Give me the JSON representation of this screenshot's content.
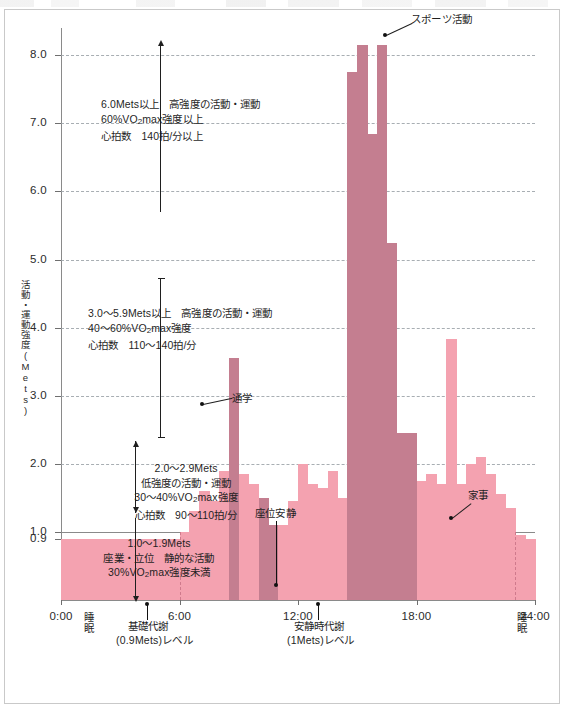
{
  "chart_data": {
    "type": "bar",
    "title": "",
    "xlabel": "",
    "ylabel": "活動・運動強度(Mets)",
    "ylim": [
      0.0,
      8.4
    ],
    "xlim": [
      0,
      24
    ],
    "grid": true,
    "legend_position": "in-plot-annotations",
    "y_ticks": [
      "8.0",
      "7.0",
      "6.0",
      "5.0",
      "4.0",
      "3.0",
      "2.0",
      "1.0",
      "0.9"
    ],
    "y_tick_values": [
      8.0,
      7.0,
      6.0,
      5.0,
      4.0,
      3.0,
      2.0,
      1.0,
      0.9
    ],
    "x_ticks": [
      "0:00",
      "6:00",
      "12:00",
      "18:00",
      "24:00"
    ],
    "x_tick_values": [
      0,
      6,
      12,
      18,
      24
    ],
    "bar_interval_hours": 0.5,
    "categories": [
      "0:00",
      "0:30",
      "1:00",
      "1:30",
      "2:00",
      "2:30",
      "3:00",
      "3:30",
      "4:00",
      "4:30",
      "5:00",
      "5:30",
      "6:00",
      "6:30",
      "7:00",
      "7:30",
      "8:00",
      "8:30",
      "9:00",
      "9:30",
      "10:00",
      "10:30",
      "11:00",
      "11:30",
      "12:00",
      "12:30",
      "13:00",
      "13:30",
      "14:00",
      "14:30",
      "15:00",
      "15:30",
      "16:00",
      "16:30",
      "17:00",
      "17:30",
      "18:00",
      "18:30",
      "19:00",
      "19:30",
      "20:00",
      "20:30",
      "21:00",
      "21:30",
      "22:00",
      "22:30",
      "23:00",
      "23:30"
    ],
    "values": [
      0.9,
      0.9,
      0.9,
      0.9,
      0.9,
      0.9,
      0.9,
      0.9,
      0.9,
      0.9,
      0.9,
      0.9,
      1.0,
      1.3,
      1.6,
      1.45,
      1.9,
      3.55,
      1.85,
      1.7,
      1.5,
      1.1,
      1.1,
      1.45,
      2.0,
      1.7,
      1.65,
      1.9,
      1.5,
      7.75,
      8.15,
      6.85,
      8.15,
      5.25,
      2.45,
      2.45,
      1.75,
      1.85,
      1.7,
      3.83,
      1.7,
      2.0,
      2.1,
      1.85,
      1.55,
      1.35,
      0.95,
      0.9
    ],
    "bar_shades": [
      "light",
      "light",
      "light",
      "light",
      "light",
      "light",
      "light",
      "light",
      "light",
      "light",
      "light",
      "light",
      "light",
      "light",
      "light",
      "light",
      "light",
      "dark",
      "light",
      "light",
      "dark",
      "dark",
      "light",
      "light",
      "light",
      "light",
      "light",
      "light",
      "light",
      "dark",
      "dark",
      "dark",
      "dark",
      "dark",
      "dark",
      "dark",
      "light",
      "light",
      "light",
      "light",
      "light",
      "light",
      "light",
      "light",
      "light",
      "light",
      "light",
      "light"
    ],
    "shade_legend": {
      "light": "#f4a2b0",
      "dark": "#c47e90"
    },
    "annotations": [
      {
        "label": "スポーツ活動",
        "at_x": "16:00",
        "at_y": 8.15
      },
      {
        "label": "通学",
        "at_x": "8:30",
        "at_y": 3.55
      },
      {
        "label": "座位安静",
        "at_x": "10:30",
        "at_y": 1.1
      },
      {
        "label": "家事",
        "at_x": "19:30",
        "at_y": 2.1
      }
    ]
  },
  "axis": {
    "y_title": "活動・運動強度(Mets)",
    "y_title_chars": [
      "活",
      "動",
      "・",
      "運",
      "動",
      "強",
      "度",
      "(",
      "M",
      "e",
      "t",
      "s",
      ")"
    ],
    "y_ticks": [
      {
        "label": "8.0",
        "value": 8.0
      },
      {
        "label": "7.0",
        "value": 7.0
      },
      {
        "label": "6.0",
        "value": 6.0
      },
      {
        "label": "5.0",
        "value": 5.0
      },
      {
        "label": "4.0",
        "value": 4.0
      },
      {
        "label": "3.0",
        "value": 3.0
      },
      {
        "label": "2.0",
        "value": 2.0
      },
      {
        "label": "1.0",
        "value": 1.0
      },
      {
        "label": "0.9",
        "value": 0.9
      }
    ],
    "x_ticks": [
      {
        "label": "0:00",
        "value": 0
      },
      {
        "label": "6:00",
        "value": 6
      },
      {
        "label": "12:00",
        "value": 12
      },
      {
        "label": "18:00",
        "value": 18
      },
      {
        "label": "24:00",
        "value": 24
      }
    ]
  },
  "intensity_bands": [
    {
      "id": "high",
      "line1": "6.0Mets以上　高強度の活動・運動",
      "line2_a": "60%VO",
      "line2_sub": "2",
      "line2_b": "max強度以上",
      "line3": "心拍数　140拍/分以上"
    },
    {
      "id": "moderate",
      "line1": "3.0〜5.9Mets以上　高強度の活動・運動",
      "line2_a": "40〜60%VO",
      "line2_sub": "2",
      "line2_b": "max強度",
      "line3": "心拍数　110〜140拍/分"
    },
    {
      "id": "low",
      "line1": "2.0〜2.9Mets",
      "line2": "低強度の活動・運動",
      "line3_a": "30〜40%VO",
      "line3_sub": "2",
      "line3_b": "max強度",
      "line4": "心拍数　90〜110拍/分"
    },
    {
      "id": "sedentary",
      "line1": "1.0〜1.9Mets",
      "line2": "座業・立位　静的な活動",
      "line3_a": "30%VO",
      "line3_sub": "2",
      "line3_b": "max強度未満"
    }
  ],
  "callouts": {
    "sports": "スポーツ活動",
    "commute": "通学",
    "sitting_rest": "座位安静",
    "housework": "家事"
  },
  "baseline_labels": {
    "sleep_left": "睡眠",
    "sleep_right": "睡眠",
    "basal_line1": "基礎代謝",
    "basal_line2": "(0.9Mets)レベル",
    "resting_line1": "安静時代謝",
    "resting_line2": "(1Mets)レベル"
  },
  "colors": {
    "bar_light": "#f4a2b0",
    "bar_dark": "#c47e90",
    "axis": "#8a8a8a",
    "grid": "#9aa0a6",
    "text": "#1f1f1f",
    "frame": "#c9c9c9"
  }
}
